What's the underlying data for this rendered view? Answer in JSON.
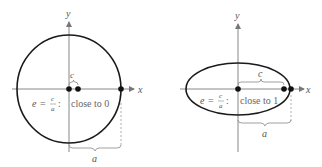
{
  "diagrams": [
    {
      "name": "circle-like-ellipse",
      "axis_x_label": "x",
      "axis_y_label": "y",
      "c_label": "c",
      "a_label": "a",
      "eq_e": "e",
      "eq_equals": "=",
      "eq_num": "c",
      "eq_den": "a",
      "eq_colon": ":",
      "description": "close to 0"
    },
    {
      "name": "elongated-ellipse",
      "axis_x_label": "x",
      "axis_y_label": "y",
      "c_label": "c",
      "a_label": "a",
      "eq_e": "e",
      "eq_equals": "=",
      "eq_num": "c",
      "eq_den": "a",
      "eq_colon": ":",
      "description": "close to 1"
    }
  ],
  "colors": {
    "curve": "#1a1a1a",
    "axis": "#777777",
    "text": "#666666",
    "dashed": "#999999"
  }
}
